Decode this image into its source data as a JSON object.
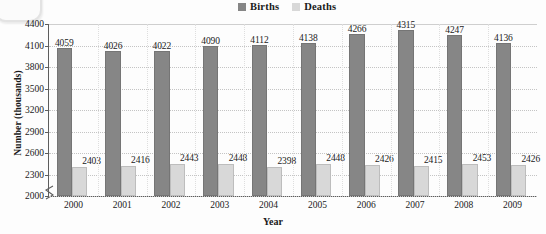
{
  "chart_data": {
    "type": "bar",
    "title": "",
    "xlabel": "Year",
    "ylabel": "Number (thousands)",
    "categories": [
      "2000",
      "2001",
      "2002",
      "2003",
      "2004",
      "2005",
      "2006",
      "2007",
      "2008",
      "2009"
    ],
    "series": [
      {
        "name": "Births",
        "color": "#868686",
        "values": [
          4059,
          4026,
          4022,
          4090,
          4112,
          4138,
          4266,
          4315,
          4247,
          4136
        ]
      },
      {
        "name": "Deaths",
        "color": "#d8d8d8",
        "values": [
          2403,
          2416,
          2443,
          2448,
          2398,
          2448,
          2426,
          2415,
          2453,
          2426
        ]
      }
    ],
    "ylim": [
      2000,
      4400
    ],
    "ytick_labels": [
      "2000",
      "2300",
      "2600",
      "2900",
      "3200",
      "3500",
      "3800",
      "4100",
      "4400"
    ],
    "ytick_values": [
      2000,
      2300,
      2600,
      2900,
      3200,
      3500,
      3800,
      4100,
      4400
    ],
    "ytick_step": 300,
    "y_axis_break": true,
    "grid": true,
    "grid_axis": "both",
    "legend_position": "top-center",
    "data_labels": true
  },
  "legend": {
    "entries": [
      {
        "label": "Births"
      },
      {
        "label": "Deaths"
      }
    ]
  },
  "axes": {
    "y_title": "Number (thousands)",
    "x_title": "Year"
  }
}
